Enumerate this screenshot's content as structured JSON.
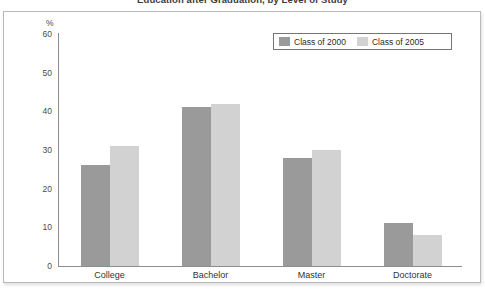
{
  "title": "Education after Graduation, by Level of Study",
  "axis_unit_label": "%",
  "legend": {
    "items": [
      {
        "label": "Class of 2000",
        "color": "#9a9a9a"
      },
      {
        "label": "Class of 2005",
        "color": "#d2d2d2"
      }
    ]
  },
  "chart_data": {
    "type": "bar",
    "title": "Education after Graduation, by Level of Study",
    "xlabel": "",
    "ylabel": "%",
    "ylim": [
      0,
      60
    ],
    "yticks": [
      0,
      10,
      20,
      30,
      40,
      50,
      60
    ],
    "grid": false,
    "legend_position": "top-right",
    "categories": [
      "College",
      "Bachelor",
      "Master",
      "Doctorate"
    ],
    "series": [
      {
        "name": "Class of 2000",
        "color": "#9a9a9a",
        "values": [
          26,
          41,
          28,
          11
        ]
      },
      {
        "name": "Class of 2005",
        "color": "#d2d2d2",
        "values": [
          31,
          42,
          30,
          8
        ]
      }
    ]
  }
}
